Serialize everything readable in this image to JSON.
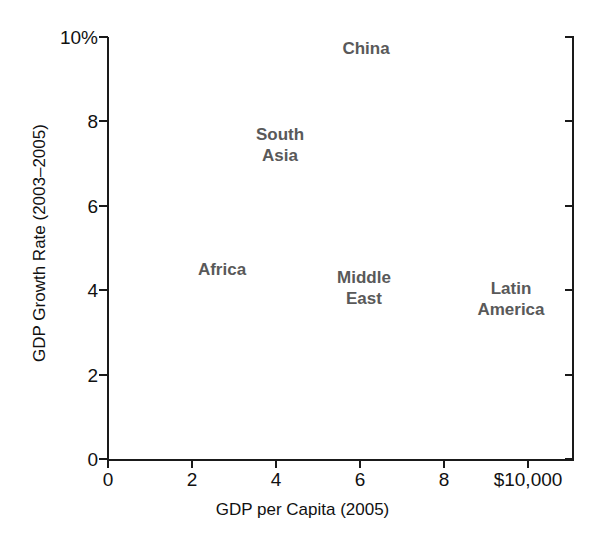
{
  "chart_data": {
    "type": "scatter",
    "title": "",
    "xlabel": "GDP per Capita (2005)",
    "ylabel": "GDP Growth Rate (2003–2005)",
    "xlim": [
      0,
      11.05
    ],
    "ylim": [
      0,
      10
    ],
    "grid": false,
    "legend": "none",
    "marker_style": "text-label-only",
    "xticks": [
      {
        "value": 0,
        "label": "0"
      },
      {
        "value": 2,
        "label": "2"
      },
      {
        "value": 4,
        "label": "4"
      },
      {
        "value": 6,
        "label": "6"
      },
      {
        "value": 8,
        "label": "8"
      },
      {
        "value": 10,
        "label": "$10,000"
      }
    ],
    "yticks": [
      {
        "value": 0,
        "label": "0"
      },
      {
        "value": 2,
        "label": "2"
      },
      {
        "value": 4,
        "label": "4"
      },
      {
        "value": 6,
        "label": "6"
      },
      {
        "value": 8,
        "label": "8"
      },
      {
        "value": 10,
        "label": "10%"
      }
    ],
    "points": [
      {
        "name": "China",
        "label": "China",
        "x": 6.15,
        "y": 9.75
      },
      {
        "name": "South Asia",
        "label": "South\nAsia",
        "x": 4.1,
        "y": 7.45
      },
      {
        "name": "Africa",
        "label": "Africa",
        "x": 2.72,
        "y": 4.5
      },
      {
        "name": "Middle East",
        "label": "Middle\nEast",
        "x": 6.1,
        "y": 4.05
      },
      {
        "name": "Latin America",
        "label": "Latin\nAmerica",
        "x": 9.6,
        "y": 3.8
      }
    ],
    "colors": {
      "axis": "#1a1a1a",
      "tick_text": "#111111",
      "point_label": "#595959",
      "background": "#ffffff"
    }
  }
}
